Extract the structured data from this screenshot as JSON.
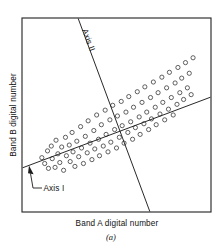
{
  "figure": {
    "caption": "(a)",
    "x_axis_label": "Band A digital number",
    "y_axis_label": "Band B digital number",
    "axis_one_label": "Axis I",
    "axis_two_label": "Axis II",
    "colors": {
      "frame": "#2b2b2b",
      "axis_line": "#1c1c1c",
      "point_stroke": "#3a3a3a",
      "background": "#ffffff",
      "text": "#111111"
    }
  },
  "chart_data": {
    "type": "scatter",
    "title": "",
    "subtitle": "",
    "xlabel": "Band A digital number",
    "ylabel": "Band B digital number",
    "xlim": [
      0,
      100
    ],
    "ylim": [
      0,
      100
    ],
    "grid": false,
    "legend": "none",
    "annotations": [
      {
        "text": "Axis I",
        "kind": "principal-component-axis-1",
        "description": "Long axis of the elongated data cloud, gentle positive slope, labelled with a leader line and arrowhead near the lower left of the plot frame",
        "line": {
          "x1": 0,
          "y1": 28,
          "x2": 100,
          "y2": 59
        }
      },
      {
        "text": "Axis II",
        "kind": "principal-component-axis-2",
        "description": "Short axis orthogonal-looking to Axis I, steep negative slope, label rotated along the line near the top of the plot frame",
        "line": {
          "x1": 30,
          "y1": 100,
          "x2": 68,
          "y2": 0
        }
      }
    ],
    "series": [
      {
        "name": "pixel observations",
        "marker": "open-circle",
        "points": [
          [
            10.5,
            28.0
          ],
          [
            12.0,
            25.0
          ],
          [
            13.5,
            31.5
          ],
          [
            14.0,
            22.5
          ],
          [
            15.5,
            34.0
          ],
          [
            16.0,
            27.5
          ],
          [
            17.5,
            23.0
          ],
          [
            18.0,
            37.0
          ],
          [
            19.0,
            30.0
          ],
          [
            20.0,
            25.5
          ],
          [
            21.0,
            33.5
          ],
          [
            22.0,
            21.5
          ],
          [
            23.0,
            38.5
          ],
          [
            23.5,
            29.0
          ],
          [
            25.0,
            34.5
          ],
          [
            25.5,
            26.0
          ],
          [
            26.5,
            41.0
          ],
          [
            27.0,
            31.0
          ],
          [
            28.0,
            23.5
          ],
          [
            29.0,
            36.5
          ],
          [
            30.0,
            28.5
          ],
          [
            31.0,
            44.0
          ],
          [
            31.5,
            33.0
          ],
          [
            32.5,
            25.0
          ],
          [
            33.5,
            39.0
          ],
          [
            34.5,
            30.5
          ],
          [
            35.0,
            47.0
          ],
          [
            36.0,
            35.5
          ],
          [
            37.0,
            27.0
          ],
          [
            38.0,
            42.0
          ],
          [
            38.5,
            32.5
          ],
          [
            39.5,
            50.0
          ],
          [
            40.5,
            37.5
          ],
          [
            41.0,
            29.0
          ],
          [
            42.0,
            45.0
          ],
          [
            43.0,
            34.0
          ],
          [
            44.0,
            52.5
          ],
          [
            44.5,
            40.0
          ],
          [
            45.5,
            31.0
          ],
          [
            46.5,
            47.5
          ],
          [
            47.0,
            36.0
          ],
          [
            48.0,
            55.0
          ],
          [
            49.0,
            42.5
          ],
          [
            50.0,
            33.0
          ],
          [
            50.5,
            49.5
          ],
          [
            51.5,
            38.5
          ],
          [
            52.5,
            57.0
          ],
          [
            53.0,
            44.5
          ],
          [
            54.0,
            35.5
          ],
          [
            55.0,
            51.5
          ],
          [
            56.0,
            41.0
          ],
          [
            56.5,
            59.5
          ],
          [
            57.5,
            46.5
          ],
          [
            58.5,
            37.5
          ],
          [
            59.0,
            54.0
          ],
          [
            60.0,
            43.5
          ],
          [
            61.0,
            62.0
          ],
          [
            62.0,
            49.0
          ],
          [
            62.5,
            40.0
          ],
          [
            63.5,
            56.5
          ],
          [
            64.5,
            45.5
          ],
          [
            65.0,
            64.5
          ],
          [
            66.0,
            51.5
          ],
          [
            67.0,
            42.5
          ],
          [
            68.0,
            59.0
          ],
          [
            68.5,
            48.0
          ],
          [
            69.5,
            67.0
          ],
          [
            70.5,
            54.0
          ],
          [
            71.0,
            45.0
          ],
          [
            72.0,
            61.5
          ],
          [
            73.0,
            50.5
          ],
          [
            74.0,
            69.5
          ],
          [
            74.5,
            56.5
          ],
          [
            75.5,
            47.5
          ],
          [
            76.5,
            64.0
          ],
          [
            77.5,
            53.0
          ],
          [
            78.0,
            72.0
          ],
          [
            79.0,
            59.0
          ],
          [
            80.0,
            50.0
          ],
          [
            81.0,
            66.5
          ],
          [
            82.0,
            55.5
          ],
          [
            82.5,
            74.5
          ],
          [
            83.5,
            61.5
          ],
          [
            84.5,
            69.0
          ],
          [
            85.5,
            58.0
          ],
          [
            86.5,
            77.0
          ],
          [
            87.5,
            64.0
          ],
          [
            88.5,
            71.5
          ],
          [
            89.5,
            60.5
          ],
          [
            90.5,
            79.5
          ]
        ]
      }
    ]
  }
}
